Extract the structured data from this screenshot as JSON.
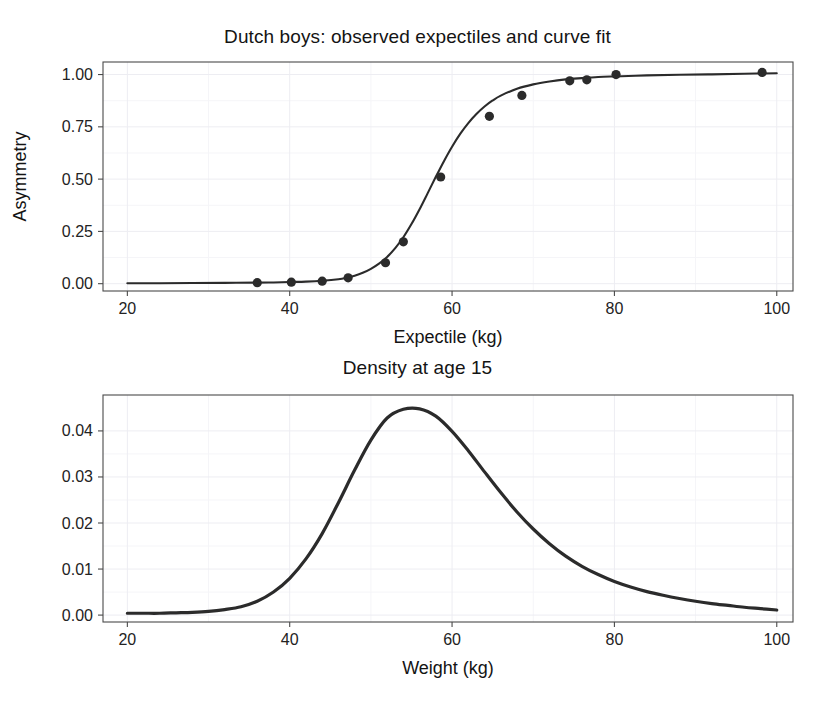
{
  "figure": {
    "background_color": "#ffffff",
    "foreground_color": "#2b2b2b",
    "grid_color": "#ededf2"
  },
  "panels": {
    "expectile": {
      "title": "Dutch boys: observed expectiles and curve fit",
      "xlabel": "Expectile (kg)",
      "ylabel": "Asymmetry"
    },
    "density": {
      "title": "Density at age 15",
      "xlabel": "Weight (kg)",
      "ylabel": ""
    }
  },
  "chart_data": [
    {
      "type": "scatter",
      "id": "expectile-curve-fit",
      "title": "Dutch boys: observed expectiles and curve fit",
      "xlabel": "Expectile (kg)",
      "ylabel": "Asymmetry",
      "xlim": [
        17,
        102
      ],
      "ylim": [
        -0.035,
        1.06
      ],
      "xticks": [
        20,
        40,
        60,
        80,
        100
      ],
      "xticklabels": [
        "20",
        "40",
        "60",
        "80",
        "100"
      ],
      "yticks": [
        0.0,
        0.25,
        0.5,
        0.75,
        1.0
      ],
      "yticklabels": [
        "0.00",
        "0.25",
        "0.50",
        "0.75",
        "1.00"
      ],
      "grid": true,
      "legend": "none",
      "series": [
        {
          "name": "observed expectiles",
          "marker": "filled-circle",
          "color": "#2b2b2b",
          "x": [
            36.0,
            40.2,
            44.0,
            47.2,
            51.8,
            54.0,
            58.6,
            64.6,
            68.6,
            74.5,
            76.6,
            80.2,
            98.2
          ],
          "y": [
            0.005,
            0.007,
            0.012,
            0.028,
            0.1,
            0.2,
            0.51,
            0.8,
            0.9,
            0.97,
            0.975,
            1.0,
            1.01
          ]
        },
        {
          "name": "curve fit",
          "marker": "none",
          "line": "solid",
          "color": "#2b2b2b",
          "x": [
            20,
            24,
            28,
            32,
            36,
            38,
            40,
            42,
            44,
            46,
            47,
            48,
            49,
            50,
            51,
            52,
            53,
            54,
            55,
            56,
            57,
            58,
            59,
            60,
            61,
            62,
            63,
            64,
            65,
            66,
            68,
            70,
            72,
            74,
            76,
            78,
            80,
            84,
            88,
            92,
            96,
            100
          ],
          "y": [
            0.002,
            0.002,
            0.003,
            0.004,
            0.005,
            0.006,
            0.008,
            0.01,
            0.014,
            0.021,
            0.028,
            0.038,
            0.052,
            0.071,
            0.096,
            0.128,
            0.17,
            0.222,
            0.285,
            0.356,
            0.433,
            0.511,
            0.586,
            0.655,
            0.716,
            0.768,
            0.811,
            0.847,
            0.876,
            0.899,
            0.932,
            0.953,
            0.967,
            0.977,
            0.983,
            0.988,
            0.991,
            0.996,
            0.999,
            1.001,
            1.004,
            1.006
          ]
        }
      ]
    },
    {
      "type": "line",
      "id": "weight-density-age-15",
      "title": "Density at age 15",
      "xlabel": "Weight (kg)",
      "ylabel": "",
      "xlim": [
        17,
        102
      ],
      "ylim": [
        -0.0015,
        0.0478
      ],
      "xticks": [
        20,
        40,
        60,
        80,
        100
      ],
      "xticklabels": [
        "20",
        "40",
        "60",
        "80",
        "100"
      ],
      "yticks": [
        0.0,
        0.01,
        0.02,
        0.03,
        0.04
      ],
      "yticklabels": [
        "0.00",
        "0.01",
        "0.02",
        "0.03",
        "0.04"
      ],
      "grid": true,
      "legend": "none",
      "peak": {
        "x": 56.0,
        "y": 0.0448
      },
      "series": [
        {
          "name": "density",
          "line": "solid",
          "color": "#2b2b2b",
          "x": [
            20,
            22,
            24,
            26,
            28,
            30,
            32,
            34,
            36,
            38,
            40,
            42,
            44,
            46,
            48,
            50,
            52,
            54,
            56,
            58,
            60,
            62,
            64,
            66,
            68,
            70,
            72,
            74,
            76,
            78,
            80,
            82,
            84,
            86,
            88,
            90,
            92,
            94,
            96,
            98,
            100
          ],
          "y": [
            0.0004,
            0.0004,
            0.0004,
            0.0005,
            0.0006,
            0.0008,
            0.0012,
            0.0018,
            0.003,
            0.005,
            0.008,
            0.0122,
            0.0177,
            0.0244,
            0.0315,
            0.038,
            0.0428,
            0.0447,
            0.0448,
            0.0432,
            0.0399,
            0.0357,
            0.0311,
            0.0266,
            0.0224,
            0.0187,
            0.0155,
            0.0128,
            0.0106,
            0.0088,
            0.0073,
            0.0061,
            0.0051,
            0.0043,
            0.0036,
            0.003,
            0.0025,
            0.0021,
            0.0017,
            0.0014,
            0.0011
          ]
        }
      ]
    }
  ]
}
